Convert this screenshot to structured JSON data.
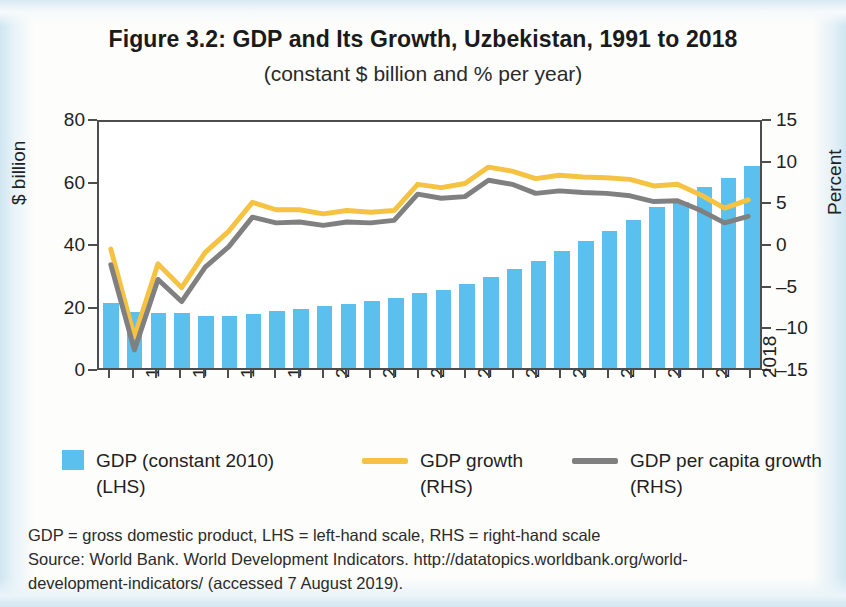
{
  "title": "Figure 3.2: GDP and Its Growth, Uzbekistan, 1991 to 2018",
  "subtitle": "(constant $ billion and % per year)",
  "legend": [
    {
      "label_line1": "GDP (constant 2010)",
      "label_line2": "(LHS)",
      "marker": "bar-swatch",
      "color": "#5bc0ed"
    },
    {
      "label_line1": "GDP growth",
      "label_line2": "(RHS)",
      "marker": "line-swatch",
      "color": "#f5c242"
    },
    {
      "label_line1": "GDP per capita growth",
      "label_line2": "(RHS)",
      "marker": "line-swatch",
      "color": "#808080"
    }
  ],
  "notes": {
    "line1": "GDP = gross domestic product, LHS = left-hand scale, RHS = right-hand scale",
    "line2": "Source: World Bank. World Development Indicators. http://datatopics.worldbank.org/world-",
    "line3": "development-indicators/ (accessed 7 August 2019)."
  },
  "chart_data": {
    "type": "bar",
    "title": "Figure 3.2: GDP and Its Growth, Uzbekistan, 1991 to 2018",
    "subtitle": "(constant $ billion and % per year)",
    "xlabel": "",
    "ylabel": "$ billion",
    "y2label": "Percent",
    "ylim": [
      0,
      80
    ],
    "y2lim": [
      -15,
      15
    ],
    "yticks": [
      0,
      20,
      40,
      60,
      80
    ],
    "y2ticks": [
      -15,
      -10,
      -5,
      0,
      5,
      10,
      15
    ],
    "grid": false,
    "legend_position": "bottom",
    "categories": [
      1991,
      1992,
      1993,
      1994,
      1995,
      1996,
      1997,
      1998,
      1999,
      2000,
      2001,
      2002,
      2003,
      2004,
      2005,
      2006,
      2007,
      2008,
      2009,
      2010,
      2011,
      2012,
      2013,
      2014,
      2015,
      2016,
      2017,
      2018
    ],
    "xtick_labels": [
      1992,
      1994,
      1996,
      1998,
      2000,
      2002,
      2004,
      2006,
      2008,
      2010,
      2012,
      2014,
      2016,
      2018
    ],
    "series": [
      {
        "name": "GDP (constant 2010) (LHS)",
        "axis": "left",
        "unit": "$ billion",
        "type": "bar",
        "color": "#5bc0ed",
        "values": [
          20.8,
          18.0,
          17.5,
          17.5,
          16.6,
          16.6,
          17.4,
          18.2,
          19.0,
          19.8,
          20.6,
          21.4,
          22.3,
          24.0,
          25.1,
          27.0,
          29.0,
          31.6,
          34.3,
          37.3,
          40.8,
          43.9,
          47.5,
          51.4,
          53.2,
          57.8,
          60.9,
          64.5
        ]
      },
      {
        "name": "GDP growth (RHS)",
        "axis": "right",
        "unit": "percent",
        "type": "line",
        "color": "#f5c242",
        "values": [
          -0.5,
          -11.2,
          -2.3,
          -5.2,
          -0.9,
          1.7,
          5.2,
          4.3,
          4.3,
          3.8,
          4.2,
          4.0,
          4.2,
          7.4,
          7.0,
          7.5,
          9.5,
          9.0,
          8.1,
          8.5,
          8.3,
          8.2,
          8.0,
          7.2,
          7.4,
          6.1,
          4.5,
          5.5
        ]
      },
      {
        "name": "GDP per capita growth (RHS)",
        "axis": "right",
        "unit": "percent",
        "type": "line",
        "color": "#808080",
        "values": [
          -2.4,
          -12.8,
          -4.2,
          -6.9,
          -2.7,
          -0.2,
          3.4,
          2.7,
          2.8,
          2.4,
          2.8,
          2.7,
          3.0,
          6.2,
          5.7,
          5.9,
          7.9,
          7.4,
          6.3,
          6.6,
          6.4,
          6.3,
          6.0,
          5.3,
          5.4,
          4.2,
          2.7,
          3.5
        ]
      }
    ]
  }
}
